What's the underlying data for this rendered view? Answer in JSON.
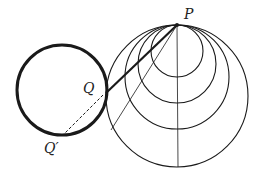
{
  "labels": {
    "P": "P",
    "Q": "Q",
    "Q_prime": "Q′"
  },
  "geometry": {
    "P": [
      177,
      25
    ],
    "Q": [
      106,
      93
    ],
    "Q_prime": [
      64,
      134
    ],
    "left_circle": {
      "cx": 62,
      "cy": 90,
      "r": 45
    },
    "tangent_circles": [
      {
        "cx": 177,
        "cy": 51,
        "r": 26
      },
      {
        "cx": 177,
        "cy": 64,
        "r": 39
      },
      {
        "cx": 177,
        "cy": 77,
        "r": 52
      },
      {
        "cx": 177,
        "cy": 96,
        "r": 71
      }
    ]
  },
  "colors": {
    "stroke": "#1a1a1a",
    "background": "#ffffff"
  }
}
